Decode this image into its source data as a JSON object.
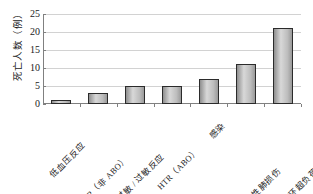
{
  "chart_data": {
    "type": "bar",
    "title": "",
    "xlabel": "",
    "ylabel": "死亡人数（例）",
    "categories": [
      "低血压反应",
      "HTR（非 ABO）",
      "过敏 / 过敏反应",
      "HTR（ABO）",
      "感染",
      "输血相关急性肺损伤",
      "输血相关循环超负荷"
    ],
    "values": [
      1,
      3,
      5,
      5,
      7,
      11,
      21
    ],
    "ylim": [
      0,
      25
    ],
    "yticks": [
      0,
      5,
      10,
      15,
      20,
      25
    ],
    "ytick_labels": [
      "0",
      "5",
      "10",
      "15",
      "20",
      "25"
    ],
    "grid": true,
    "legend": "none",
    "bar_color": "#b8b8b8",
    "bar_edge_color": "#2b2b2b",
    "gridline_color": "#d2d2d2",
    "axis_color": "#808080",
    "text_color": "#1a1a1a"
  }
}
